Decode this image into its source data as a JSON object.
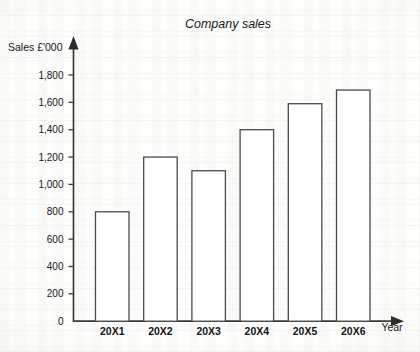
{
  "chart_data": {
    "type": "bar",
    "title": "Company sales",
    "xlabel": "Year",
    "ylabel": "Sales £'000",
    "categories": [
      "20X1",
      "20X2",
      "20X3",
      "20X4",
      "20X5",
      "20X6"
    ],
    "values": [
      800,
      1200,
      1100,
      1400,
      1590,
      1690
    ],
    "ylim": [
      0,
      1800
    ],
    "ytick_values": [
      0,
      200,
      400,
      600,
      800,
      1000,
      1200,
      1400,
      1600,
      1800
    ],
    "ytick_labels": [
      "0",
      "200",
      "400",
      "600",
      "800",
      "1,000",
      "1,200",
      "1,400",
      "1,600",
      "1,800"
    ],
    "grid": false,
    "legend": false,
    "legend_position": "none",
    "series": [
      {
        "name": "Sales",
        "values": [
          800,
          1200,
          1100,
          1400,
          1590,
          1690
        ]
      }
    ],
    "bar_fill_color": "#ffffff",
    "bar_edge_color": "#4a4a4a",
    "axis_color": "#3b3b3b",
    "text_color": "#161616"
  }
}
